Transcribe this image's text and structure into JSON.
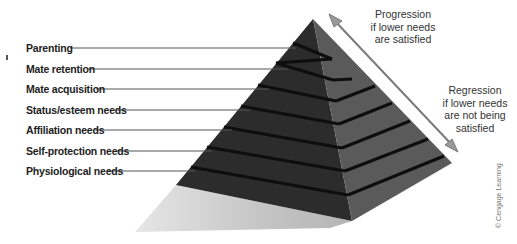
{
  "diagram": {
    "type": "pyramid",
    "levels_top_to_bottom": [
      "Parenting",
      "Mate retention",
      "Mate acquisition",
      "Status/esteem needs",
      "Affiliation needs",
      "Self-protection needs",
      "Physiological needs"
    ],
    "progression_note": [
      "Progression",
      "if lower needs",
      "are satisfied"
    ],
    "regression_note": [
      "Regression",
      "if lower needs",
      "are not being",
      "satisfied"
    ],
    "credit": "© Cengage Learning"
  },
  "colors": {
    "front_face": "#2b2b2b",
    "right_face": "#575757",
    "stripe": "#111111",
    "shadow": "#c8c8c8",
    "arrow": "#7a7a7a",
    "leader_line": "#555555"
  }
}
